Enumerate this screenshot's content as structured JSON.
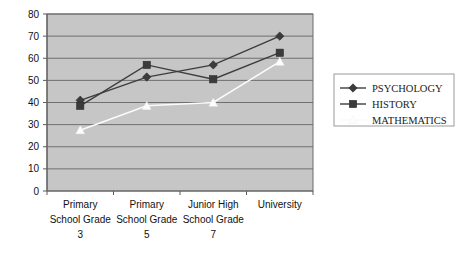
{
  "chart_data": {
    "type": "line",
    "title": "",
    "subtitle": "",
    "xlabel": "",
    "ylabel": "",
    "ylim": [
      0,
      80
    ],
    "ytick_step": 10,
    "yticks": [
      "0",
      "10",
      "20",
      "30",
      "40",
      "50",
      "60",
      "70",
      "80"
    ],
    "grid": true,
    "legend_position": "right",
    "categories": [
      "Primary School Grade 3",
      "Primary School Grade 5",
      "Junior High School Grade 7",
      "University"
    ],
    "category_lines": [
      [
        "Primary",
        "School Grade",
        "3"
      ],
      [
        "Primary",
        "School Grade",
        "5"
      ],
      [
        "Junior High",
        "School Grade",
        "7"
      ],
      [
        "University",
        "",
        ""
      ]
    ],
    "series": [
      {
        "name": "PSYCHOLOGY",
        "marker": "diamond",
        "color": "#3b3b3b",
        "values": [
          41,
          51.5,
          57,
          70
        ]
      },
      {
        "name": "HISTORY",
        "marker": "square",
        "color": "#3b3b3b",
        "values": [
          38.5,
          57,
          50.5,
          62.5
        ]
      },
      {
        "name": "MATHEMATICS",
        "marker": "triangle",
        "color": "#fdfdfd",
        "values": [
          27.5,
          38.5,
          40,
          58.5
        ]
      }
    ]
  },
  "legend": {
    "entries": [
      {
        "label": "PSYCHOLOGY",
        "marker": "diamond-marker-icon"
      },
      {
        "label": "HISTORY",
        "marker": "square-marker-icon"
      },
      {
        "label": "MATHEMATICS",
        "marker": "triangle-marker-icon"
      }
    ]
  },
  "colors": {
    "plot_background": "#c6c6c6",
    "gridline": "#6f6f6f",
    "dark_series": "#3b3b3b",
    "light_series": "#fdfdfd",
    "page_background": "#ffffff"
  }
}
